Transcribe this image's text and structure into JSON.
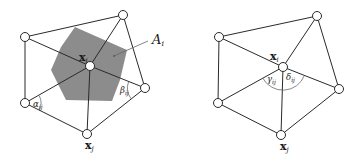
{
  "figure": {
    "panels": [
      {
        "id": "left",
        "nodes": [
          {
            "name": "center",
            "x": 90,
            "y": 66
          },
          {
            "name": "top-left",
            "x": 25,
            "y": 37
          },
          {
            "name": "top-right",
            "x": 123,
            "y": 15
          },
          {
            "name": "right",
            "x": 145,
            "y": 88
          },
          {
            "name": "bottom",
            "x": 87,
            "y": 134
          },
          {
            "name": "bottom-left",
            "x": 25,
            "y": 103
          }
        ],
        "region_polygon": "75,27 127,50 120,80 112,101 66,100 51,70 61,47",
        "labels": {
          "center": {
            "main": "x",
            "sub": "i"
          },
          "bottom": {
            "main": "x",
            "sub": "j"
          },
          "area": {
            "main": "A",
            "sub": "i"
          },
          "alpha": {
            "main": "α",
            "sub": "ij"
          },
          "beta": {
            "main": "β",
            "sub": "ij"
          }
        }
      },
      {
        "id": "right",
        "nodes": [
          {
            "name": "center",
            "x": 283,
            "y": 67
          },
          {
            "name": "top-left",
            "x": 219,
            "y": 37
          },
          {
            "name": "top-right",
            "x": 317,
            "y": 16
          },
          {
            "name": "right",
            "x": 339,
            "y": 89
          },
          {
            "name": "bottom",
            "x": 281,
            "y": 135
          },
          {
            "name": "bottom-left",
            "x": 218,
            "y": 103
          }
        ],
        "labels": {
          "center": {
            "main": "x",
            "sub": "i"
          },
          "bottom": {
            "main": "x",
            "sub": "j"
          },
          "gamma": {
            "main": "γ",
            "sub": "ij"
          },
          "delta": {
            "main": "δ",
            "sub": "ij"
          }
        }
      }
    ],
    "colors": {
      "region_fill": "#8c8c8c",
      "line": "#2a2a2a",
      "node_fill": "#ffffff"
    }
  }
}
